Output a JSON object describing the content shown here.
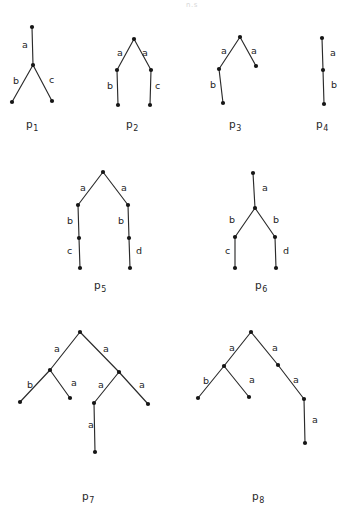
{
  "figure": {
    "page_artifact_text": "n.s",
    "node_radius": 2.1,
    "colors": {
      "ink": "#2b2b2b",
      "node_fill": "#151515",
      "label_ink": "#242424",
      "caption_ink": "#262626",
      "background": "#ffffff",
      "artifact": "#d7d7d7"
    },
    "trees": [
      {
        "id": "p1",
        "caption_base": "p",
        "caption_sub": "1",
        "caption_x": 26,
        "caption_y": 128,
        "nodes": [
          {
            "name": "root",
            "x": 32,
            "y": 27
          },
          {
            "name": "v1",
            "x": 33,
            "y": 65
          },
          {
            "name": "leaf-left",
            "x": 12,
            "y": 102
          },
          {
            "name": "leaf-right",
            "x": 52,
            "y": 101
          }
        ],
        "edges": [
          {
            "from": "root",
            "to": "v1",
            "label": "a",
            "lx": 22,
            "ly": 48
          },
          {
            "from": "v1",
            "to": "leaf-left",
            "label": "b",
            "lx": 13,
            "ly": 84
          },
          {
            "from": "v1",
            "to": "leaf-right",
            "label": "c",
            "lx": 49,
            "ly": 83
          }
        ]
      },
      {
        "id": "p2",
        "caption_base": "p",
        "caption_sub": "2",
        "caption_x": 126,
        "caption_y": 128,
        "nodes": [
          {
            "name": "apex",
            "x": 134,
            "y": 39
          },
          {
            "name": "v-left",
            "x": 117,
            "y": 70
          },
          {
            "name": "v-right",
            "x": 151,
            "y": 70
          },
          {
            "name": "leaf-left",
            "x": 118,
            "y": 105
          },
          {
            "name": "leaf-right",
            "x": 150,
            "y": 105
          }
        ],
        "edges": [
          {
            "from": "apex",
            "to": "v-left",
            "label": "a",
            "lx": 117,
            "ly": 56
          },
          {
            "from": "apex",
            "to": "v-right",
            "label": "a",
            "lx": 142,
            "ly": 56
          },
          {
            "from": "v-left",
            "to": "leaf-left",
            "label": "b",
            "lx": 107,
            "ly": 89
          },
          {
            "from": "v-right",
            "to": "leaf-right",
            "label": "c",
            "lx": 155,
            "ly": 89
          }
        ]
      },
      {
        "id": "p3",
        "caption_base": "p",
        "caption_sub": "3",
        "caption_x": 229,
        "caption_y": 128,
        "nodes": [
          {
            "name": "root",
            "x": 240,
            "y": 37
          },
          {
            "name": "v-left",
            "x": 219,
            "y": 69
          },
          {
            "name": "leaf-right",
            "x": 256,
            "y": 66
          },
          {
            "name": "leaf-bottom",
            "x": 223,
            "y": 103
          }
        ],
        "edges": [
          {
            "from": "root",
            "to": "v-left",
            "label": "a",
            "lx": 221,
            "ly": 54
          },
          {
            "from": "root",
            "to": "leaf-right",
            "label": "a",
            "lx": 251,
            "ly": 54
          },
          {
            "from": "v-left",
            "to": "leaf-bottom",
            "label": "b",
            "lx": 210,
            "ly": 88
          }
        ]
      },
      {
        "id": "p4",
        "caption_base": "p",
        "caption_sub": "4",
        "caption_x": 316,
        "caption_y": 128,
        "nodes": [
          {
            "name": "root",
            "x": 322,
            "y": 38
          },
          {
            "name": "v1",
            "x": 323,
            "y": 70
          },
          {
            "name": "leaf",
            "x": 324,
            "y": 104
          }
        ],
        "edges": [
          {
            "from": "root",
            "to": "v1",
            "label": "a",
            "lx": 330,
            "ly": 56
          },
          {
            "from": "v1",
            "to": "leaf",
            "label": "b",
            "lx": 331,
            "ly": 88
          }
        ]
      },
      {
        "id": "p5",
        "caption_base": "p",
        "caption_sub": "5",
        "caption_x": 94,
        "caption_y": 289,
        "nodes": [
          {
            "name": "root",
            "x": 103,
            "y": 172
          },
          {
            "name": "v-left",
            "x": 78,
            "y": 205
          },
          {
            "name": "v-right",
            "x": 128,
            "y": 205
          },
          {
            "name": "m-left",
            "x": 79,
            "y": 238
          },
          {
            "name": "m-right",
            "x": 129,
            "y": 238
          },
          {
            "name": "leaf-left",
            "x": 80,
            "y": 268
          },
          {
            "name": "leaf-right",
            "x": 130,
            "y": 268
          }
        ],
        "edges": [
          {
            "from": "root",
            "to": "v-left",
            "label": "a",
            "lx": 80,
            "ly": 191
          },
          {
            "from": "root",
            "to": "v-right",
            "label": "a",
            "lx": 121,
            "ly": 191
          },
          {
            "from": "v-left",
            "to": "m-left",
            "label": "b",
            "lx": 67,
            "ly": 224
          },
          {
            "from": "v-right",
            "to": "m-right",
            "label": "b",
            "lx": 118,
            "ly": 224
          },
          {
            "from": "m-left",
            "to": "leaf-left",
            "label": "c",
            "lx": 67,
            "ly": 254
          },
          {
            "from": "m-right",
            "to": "leaf-right",
            "label": "d",
            "lx": 136,
            "ly": 254
          }
        ]
      },
      {
        "id": "p6",
        "caption_base": "p",
        "caption_sub": "6",
        "caption_x": 255,
        "caption_y": 289,
        "nodes": [
          {
            "name": "root",
            "x": 253,
            "y": 173
          },
          {
            "name": "v1",
            "x": 255,
            "y": 208
          },
          {
            "name": "v-left",
            "x": 235,
            "y": 237
          },
          {
            "name": "v-right",
            "x": 275,
            "y": 237
          },
          {
            "name": "leaf-left",
            "x": 235,
            "y": 268
          },
          {
            "name": "leaf-right",
            "x": 276,
            "y": 268
          }
        ],
        "edges": [
          {
            "from": "root",
            "to": "v1",
            "label": "a",
            "lx": 262,
            "ly": 191
          },
          {
            "from": "v1",
            "to": "v-left",
            "label": "b",
            "lx": 229,
            "ly": 223
          },
          {
            "from": "v1",
            "to": "v-right",
            "label": "b",
            "lx": 273,
            "ly": 223
          },
          {
            "from": "v-left",
            "to": "leaf-left",
            "label": "c",
            "lx": 225,
            "ly": 254
          },
          {
            "from": "v-right",
            "to": "leaf-right",
            "label": "d",
            "lx": 283,
            "ly": 254
          }
        ]
      },
      {
        "id": "p7",
        "caption_base": "p",
        "caption_sub": "7",
        "caption_x": 82,
        "caption_y": 500,
        "nodes": [
          {
            "name": "root",
            "x": 80,
            "y": 332
          },
          {
            "name": "v-left",
            "x": 50,
            "y": 370
          },
          {
            "name": "v-right",
            "x": 119,
            "y": 372
          },
          {
            "name": "leaf-ll",
            "x": 20,
            "y": 402
          },
          {
            "name": "leaf-lr",
            "x": 70,
            "y": 398
          },
          {
            "name": "v-mid",
            "x": 94,
            "y": 403
          },
          {
            "name": "leaf-rr",
            "x": 148,
            "y": 404
          },
          {
            "name": "leaf-bottom",
            "x": 95,
            "y": 452
          }
        ],
        "edges": [
          {
            "from": "root",
            "to": "v-left",
            "label": "a",
            "lx": 54,
            "ly": 352
          },
          {
            "from": "root",
            "to": "v-right",
            "label": "a",
            "lx": 103,
            "ly": 352
          },
          {
            "from": "v-left",
            "to": "leaf-ll",
            "label": "b",
            "lx": 27,
            "ly": 388
          },
          {
            "from": "v-left",
            "to": "leaf-lr",
            "label": "a",
            "lx": 71,
            "ly": 386
          },
          {
            "from": "v-right",
            "to": "v-mid",
            "label": "a",
            "lx": 98,
            "ly": 388
          },
          {
            "from": "v-right",
            "to": "leaf-rr",
            "label": "a",
            "lx": 139,
            "ly": 388
          },
          {
            "from": "v-mid",
            "to": "leaf-bottom",
            "label": "a",
            "lx": 88,
            "ly": 428
          }
        ]
      },
      {
        "id": "p8",
        "caption_base": "p",
        "caption_sub": "8",
        "caption_x": 252,
        "caption_y": 500,
        "nodes": [
          {
            "name": "root",
            "x": 251,
            "y": 332
          },
          {
            "name": "v-left",
            "x": 224,
            "y": 366
          },
          {
            "name": "v-right",
            "x": 278,
            "y": 365
          },
          {
            "name": "leaf-ll",
            "x": 198,
            "y": 398
          },
          {
            "name": "leaf-lr",
            "x": 249,
            "y": 397
          },
          {
            "name": "v-rr",
            "x": 304,
            "y": 399
          },
          {
            "name": "leaf-bottom",
            "x": 305,
            "y": 443
          }
        ],
        "edges": [
          {
            "from": "root",
            "to": "v-left",
            "label": "a",
            "lx": 229,
            "ly": 351
          },
          {
            "from": "root",
            "to": "v-right",
            "label": "a",
            "lx": 272,
            "ly": 351
          },
          {
            "from": "v-left",
            "to": "leaf-ll",
            "label": "b",
            "lx": 203,
            "ly": 384
          },
          {
            "from": "v-left",
            "to": "leaf-lr",
            "label": "a",
            "lx": 249,
            "ly": 383
          },
          {
            "from": "v-right",
            "to": "v-rr",
            "label": "a",
            "lx": 293,
            "ly": 383
          },
          {
            "from": "v-rr",
            "to": "leaf-bottom",
            "label": "a",
            "lx": 312,
            "ly": 423
          }
        ]
      }
    ]
  },
  "chart_data": {
    "type": "diagram",
    "title": "",
    "subtitle": "",
    "items": [
      {
        "name": "p1",
        "edge_labels": [
          "a",
          "b",
          "c"
        ],
        "node_count": 4,
        "edge_count": 3
      },
      {
        "name": "p2",
        "edge_labels": [
          "a",
          "a",
          "b",
          "c"
        ],
        "node_count": 5,
        "edge_count": 4
      },
      {
        "name": "p3",
        "edge_labels": [
          "a",
          "a",
          "b"
        ],
        "node_count": 4,
        "edge_count": 3
      },
      {
        "name": "p4",
        "edge_labels": [
          "a",
          "b"
        ],
        "node_count": 3,
        "edge_count": 2
      },
      {
        "name": "p5",
        "edge_labels": [
          "a",
          "a",
          "b",
          "b",
          "c",
          "d"
        ],
        "node_count": 7,
        "edge_count": 6
      },
      {
        "name": "p6",
        "edge_labels": [
          "a",
          "b",
          "b",
          "c",
          "d"
        ],
        "node_count": 6,
        "edge_count": 5
      },
      {
        "name": "p7",
        "edge_labels": [
          "a",
          "a",
          "b",
          "a",
          "a",
          "a",
          "a"
        ],
        "node_count": 8,
        "edge_count": 7
      },
      {
        "name": "p8",
        "edge_labels": [
          "a",
          "a",
          "b",
          "a",
          "a",
          "a"
        ],
        "node_count": 7,
        "edge_count": 6
      }
    ],
    "legend": [],
    "xlabel": "",
    "ylabel": ""
  }
}
